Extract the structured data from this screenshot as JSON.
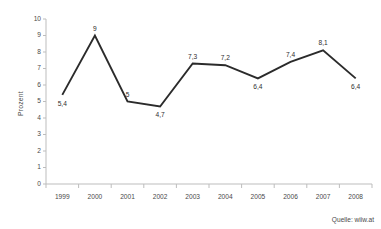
{
  "chart_data": {
    "type": "line",
    "title": "",
    "subtitle": "",
    "xlabel": "",
    "ylabel": "Prozent",
    "categories": [
      "1999",
      "2000",
      "2001",
      "2002",
      "2003",
      "2004",
      "2005",
      "2006",
      "2007",
      "2008"
    ],
    "values": [
      5.4,
      9,
      5,
      4.7,
      7.3,
      7.2,
      6.4,
      7.4,
      8.1,
      6.4
    ],
    "point_labels": [
      "5,4",
      "9",
      "5",
      "4,7",
      "7,3",
      "7,2",
      "6,4",
      "7,4",
      "8,1",
      "6,4"
    ],
    "label_positions": [
      "below",
      "above",
      "above",
      "below",
      "above",
      "above",
      "below",
      "above",
      "above",
      "below"
    ],
    "ylim": [
      0,
      10
    ],
    "ytick_values": [
      0,
      1,
      2,
      3,
      4,
      5,
      6,
      7,
      8,
      9,
      10
    ],
    "ytick_labels": [
      "0",
      "1",
      "2",
      "3",
      "4",
      "5",
      "6",
      "7",
      "8",
      "9",
      "10"
    ],
    "grid": false,
    "legend": false,
    "legend_position": "none",
    "series_color": "#2b2b2b",
    "axis_color": "#bdbdbd",
    "background_color": "#ffffff"
  },
  "source": {
    "text": "Quelle: wiiw.at"
  }
}
